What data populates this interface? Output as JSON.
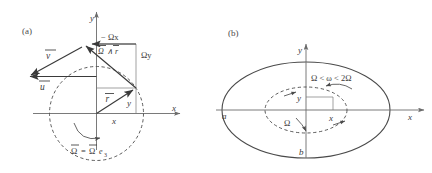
{
  "figure": {
    "background_color": "#ffffff",
    "ink_color": "#3a3a3a",
    "panels": [
      {
        "tag": "(a)",
        "description": "velocity decomposition in rotating frame",
        "axes": {
          "x_label": "x",
          "y_label": "y"
        },
        "labels": {
          "vector_v": "v",
          "vector_u": "u",
          "vector_r": "r",
          "cross_product": "∧ r",
          "cross_product_head": "Ω",
          "minus_omega_x": "− Ωx",
          "omega_y": "Ωy",
          "component_x": "x",
          "component_y": "y",
          "omega_definition_lhs": "Ω",
          "omega_definition_eq": "=",
          "omega_definition_rhs": "Ω",
          "omega_definition_basis": "e",
          "omega_definition_basis_sub": "3"
        }
      },
      {
        "tag": "(b)",
        "description": "elliptical orbit with inner dashed ellipse and rotation rates",
        "axes": {
          "x_label": "x",
          "y_label": "y"
        },
        "labels": {
          "semi_major": "a",
          "semi_minor": "b",
          "inequality": "Ω < ω < 2Ω",
          "omega_inner": "Ω",
          "inner_x": "x",
          "inner_y": "y"
        }
      }
    ]
  }
}
